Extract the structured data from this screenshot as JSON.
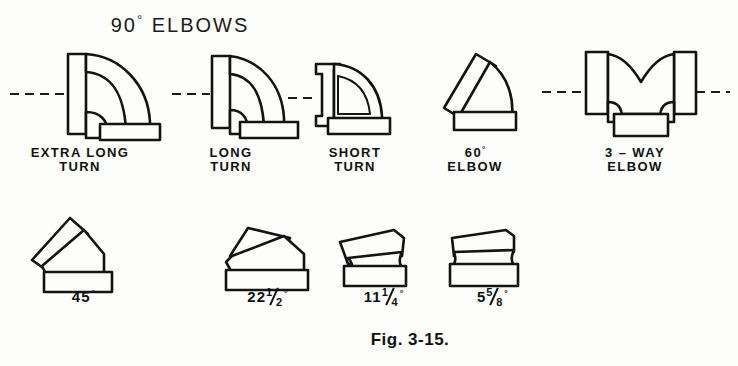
{
  "figure": {
    "title": "90° ELBOWS",
    "title_text": "90",
    "title_degree": "°",
    "title_rest": " ELBOWS",
    "caption": "Fig. 3-15.",
    "line_color": "#131313",
    "background_color": "#fdfdfb"
  },
  "top_row": [
    {
      "name": "extra-long-turn",
      "label": "EXTRA LONG\nTURN"
    },
    {
      "name": "long-turn",
      "label": "LONG\nTURN"
    },
    {
      "name": "short-turn",
      "label": "SHORT\nTURN"
    },
    {
      "name": "sixty-degree-elbow",
      "label_line1_num": "60",
      "label_line1_deg": "°",
      "label_line2": "ELBOW"
    },
    {
      "name": "three-way-elbow",
      "label": "3 – WAY\nELBOW"
    }
  ],
  "bottom_row": [
    {
      "name": "forty-five-degree",
      "whole": "45",
      "num": "",
      "den": "",
      "degree": "°"
    },
    {
      "name": "twenty-two-and-half-degree",
      "whole": "22",
      "num": "1",
      "den": "2",
      "degree": "°"
    },
    {
      "name": "eleven-and-quarter-degree",
      "whole": "11",
      "num": "1",
      "den": "4",
      "degree": "°"
    },
    {
      "name": "five-and-five-eighths-degree",
      "whole": "5",
      "num": "5",
      "den": "8",
      "degree": "°"
    }
  ]
}
